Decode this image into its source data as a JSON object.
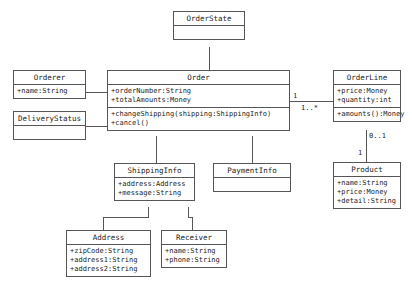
{
  "diagram": {
    "style": {
      "line_color": "#555555",
      "fill_color": "#ffffff",
      "text_color": "#222222"
    },
    "classes": {
      "order_state": {
        "name": "OrderState",
        "attributes": [],
        "operations": []
      },
      "orderer": {
        "name": "Orderer",
        "attributes": [
          "+name:String"
        ],
        "operations": []
      },
      "delivery_status": {
        "name": "DeliveryStatus",
        "attributes": [],
        "operations": []
      },
      "order": {
        "name": "Order",
        "attributes": [
          "+orderNumber:String",
          "+totalAmounts:Money"
        ],
        "operations": [
          "+changeShipping(shipping:ShippingInfo)",
          "+cancel()"
        ]
      },
      "order_line": {
        "name": "OrderLine",
        "attributes": [
          "+price:Money",
          "+quantity:int"
        ],
        "operations": [
          "+amounts():Money"
        ]
      },
      "shipping_info": {
        "name": "ShippingInfo",
        "attributes": [
          "+address:Address",
          "+message:String"
        ],
        "operations": []
      },
      "payment_info": {
        "name": "PaymentInfo",
        "attributes": [],
        "operations": []
      },
      "product": {
        "name": "Product",
        "attributes": [
          "+name:String",
          "+price:Money",
          "+detail:String"
        ],
        "operations": []
      },
      "address": {
        "name": "Address",
        "attributes": [
          "+zipCode:String",
          "+address1:String",
          "+address2:String"
        ],
        "operations": []
      },
      "receiver": {
        "name": "Receiver",
        "attributes": [
          "+name:String",
          "+phone:String"
        ],
        "operations": []
      }
    },
    "multiplicities": {
      "order_to_orderline_source": "1",
      "order_to_orderline_target": "1..*",
      "orderline_to_product_source": "0..1",
      "orderline_to_product_target": "1"
    },
    "associations": [
      {
        "from": "Orderer",
        "to": "Order",
        "label": ""
      },
      {
        "from": "DeliveryStatus",
        "to": "Order",
        "label": ""
      },
      {
        "from": "OrderState",
        "to": "Order",
        "label": ""
      },
      {
        "from": "Order",
        "to": "OrderLine",
        "label": "1 .. 1..*"
      },
      {
        "from": "Order",
        "to": "ShippingInfo",
        "label": ""
      },
      {
        "from": "Order",
        "to": "PaymentInfo",
        "label": ""
      },
      {
        "from": "OrderLine",
        "to": "Product",
        "label": "0..1 .. 1"
      },
      {
        "from": "ShippingInfo",
        "to": "Address",
        "label": ""
      },
      {
        "from": "ShippingInfo",
        "to": "Receiver",
        "label": ""
      }
    ]
  }
}
